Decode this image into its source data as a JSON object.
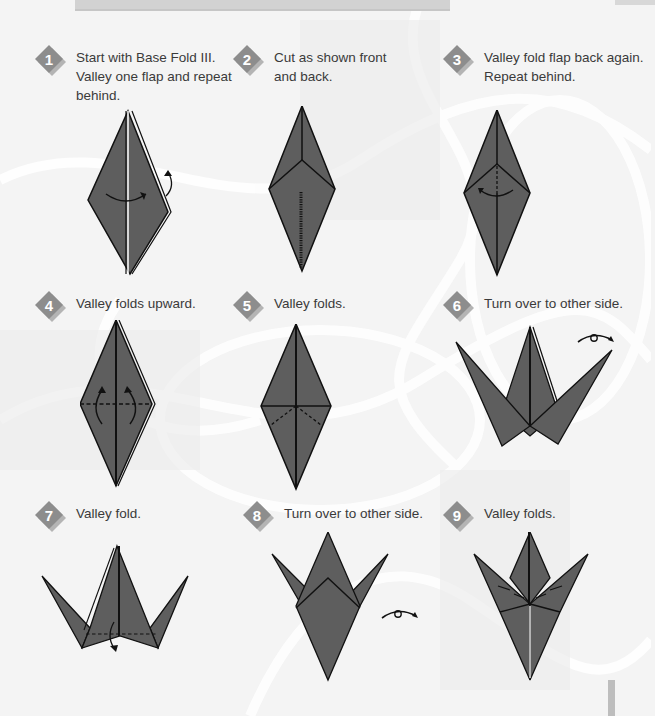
{
  "page": {
    "colors": {
      "paper": "#5e5e5e",
      "crease": "#111111",
      "badge": "#8d8d8d",
      "badge_shadow": "#b4b4b4",
      "text": "#3a3a3a",
      "background": "#f4f4f4"
    }
  },
  "steps": [
    {
      "number": "1",
      "text": "Start with Base Fold III.\nValley one flap and repeat\nbehind.",
      "figure": "diamond-fold-flap"
    },
    {
      "number": "2",
      "text": "Cut as shown front\nand back.",
      "figure": "kite-cut-line"
    },
    {
      "number": "3",
      "text": "Valley fold flap back again.\nRepeat behind.",
      "figure": "kite-valley-back"
    },
    {
      "number": "4",
      "text": "Valley folds upward.",
      "figure": "diamond-fold-upward"
    },
    {
      "number": "5",
      "text": "Valley folds.",
      "figure": "diamond-valley-folds"
    },
    {
      "number": "6",
      "text": "Turn over to other side.",
      "figure": "three-point-turnover"
    },
    {
      "number": "7",
      "text": "Valley fold.",
      "figure": "three-point-valley"
    },
    {
      "number": "8",
      "text": "Turn over to other side.",
      "figure": "tulip-turnover"
    },
    {
      "number": "9",
      "text": "Valley folds.",
      "figure": "tulip-valley-folds"
    }
  ]
}
